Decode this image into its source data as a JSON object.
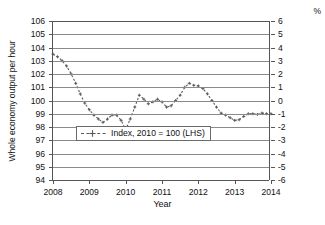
{
  "chart_data": {
    "type": "line",
    "title": "",
    "xlabel": "Year",
    "ylabel": "Whole economy output per hour",
    "ylabel_right": "%",
    "xlim": [
      2008.0,
      2014.0
    ],
    "ylim": [
      94,
      106
    ],
    "ylim_right": [
      -6,
      6
    ],
    "grid": true,
    "legend_position": "lower center",
    "yticks_left": [
      106,
      105,
      104,
      103,
      102,
      101,
      100,
      99,
      98,
      97,
      96,
      95,
      94
    ],
    "yticks_right": [
      6,
      5,
      4,
      3,
      2,
      1,
      0,
      -1,
      -2,
      -3,
      -4,
      -5,
      -6
    ],
    "xticks": [
      2008,
      2009,
      2010,
      2011,
      2012,
      2013,
      2014
    ],
    "series": [
      {
        "name": "Index, 2010 = 100 (LHS)",
        "style": "dashed",
        "marker": "plus",
        "color": "#5a5a5a",
        "axis": "left",
        "x": [
          2008.0,
          2008.125,
          2008.25,
          2008.375,
          2008.5,
          2008.625,
          2008.75,
          2008.875,
          2009.0,
          2009.125,
          2009.25,
          2009.375,
          2009.5,
          2009.625,
          2009.75,
          2009.875,
          2010.0,
          2010.125,
          2010.25,
          2010.375,
          2010.5,
          2010.625,
          2010.75,
          2010.875,
          2011.0,
          2011.125,
          2011.25,
          2011.375,
          2011.5,
          2011.625,
          2011.75,
          2011.875,
          2012.0,
          2012.125,
          2012.25,
          2012.375,
          2012.5,
          2012.625,
          2012.75,
          2012.875,
          2013.0,
          2013.125,
          2013.25,
          2013.375,
          2013.5,
          2013.625,
          2013.75,
          2013.875,
          2014.0
        ],
        "y": [
          103.5,
          103.3,
          103.0,
          102.6,
          102.0,
          101.3,
          100.5,
          99.8,
          99.3,
          98.9,
          98.6,
          98.35,
          98.6,
          98.9,
          98.9,
          98.5,
          97.8,
          98.6,
          99.5,
          100.4,
          100.1,
          99.75,
          99.9,
          100.1,
          99.9,
          99.5,
          99.6,
          100.0,
          100.4,
          101.0,
          101.3,
          101.15,
          101.1,
          100.9,
          100.5,
          100.0,
          99.5,
          99.05,
          98.9,
          98.7,
          98.5,
          98.55,
          98.8,
          99.0,
          99.0,
          98.95,
          99.05,
          99.0,
          99.0
        ]
      }
    ],
    "legend_entries": [
      {
        "label": "Index, 2010 = 100 (LHS)"
      }
    ]
  },
  "axes": {
    "left_title": "Whole economy output per hour",
    "right_title": "%",
    "bottom_title": "Year"
  }
}
